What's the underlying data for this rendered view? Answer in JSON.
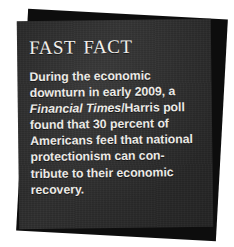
{
  "callout": {
    "type": "fast-fact-sidebar",
    "title": "Fast Fact",
    "colors": {
      "card_background": "#2f2f2f",
      "shadow_layer": "#0d0d0d",
      "text": "#eceae6",
      "page_background": "#ffffff"
    },
    "body_full_text": "During the economic downturn in early 2009, a Financial Times/Harris poll found that 30 percent of Americans feel that national protectionism can contribute to their economic recovery.",
    "body_lines": [
      {
        "id": "line-1",
        "text": "During the economic"
      },
      {
        "id": "line-2",
        "text": "downturn in early 2009, a"
      },
      {
        "id": "line-3",
        "italic": "Financial Times",
        "text": "/Harris poll"
      },
      {
        "id": "line-4",
        "text": "found that 30 percent of"
      },
      {
        "id": "line-5",
        "text": "Americans feel that national"
      },
      {
        "id": "line-6",
        "text": "protectionism can con-"
      },
      {
        "id": "line-7",
        "text": "tribute to their economic"
      },
      {
        "id": "line-8",
        "text": "recovery."
      }
    ],
    "cited_publication": "Financial Times",
    "cited_poll": "Harris poll",
    "statistic": "30 percent",
    "year": "2009"
  }
}
